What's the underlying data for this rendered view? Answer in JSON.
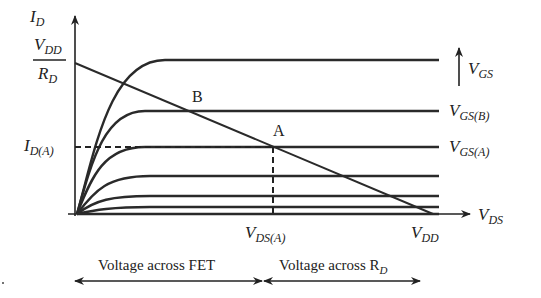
{
  "figure": {
    "type": "diagram",
    "axes": {
      "y_label": {
        "main": "I",
        "sub": "D"
      },
      "x_label": {
        "main": "V",
        "sub": "DS"
      }
    },
    "y_intercept_label": {
      "num_main": "V",
      "num_sub": "DD",
      "den_main": "R",
      "den_sub": "D"
    },
    "x_intercept_label": {
      "main": "V",
      "sub": "DD"
    },
    "point_labels": {
      "a": "A",
      "b": "B"
    },
    "id_a_label": {
      "main": "I",
      "sub": "D(A)"
    },
    "vds_a_label": {
      "main": "V",
      "sub": "DS(A)"
    },
    "vgs_arrow_label": {
      "main": "V",
      "sub": "GS"
    },
    "curve_labels": [
      {
        "main": "V",
        "sub": "GS(B)"
      },
      {
        "main": "V",
        "sub": "GS(A)"
      }
    ],
    "bottom": {
      "left_label": "Voltage across FET",
      "right_label_main": "Voltage across R",
      "right_label_sub": "D"
    },
    "curve_levels_px": [
      60,
      111,
      147,
      176,
      196,
      207,
      214
    ]
  }
}
